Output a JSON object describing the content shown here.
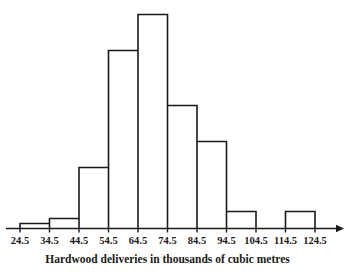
{
  "chart_data": {
    "type": "bar",
    "title": "",
    "subtitle": "",
    "xlabel": "Hardwood deliveries in thousands of cubic metres",
    "ylabel": "",
    "grid": false,
    "legend": null,
    "bin_edges": [
      24.5,
      34.5,
      44.5,
      54.5,
      64.5,
      74.5,
      84.5,
      94.5,
      104.5,
      114.5,
      124.5
    ],
    "tick_labels": [
      "24.5",
      "34.5",
      "44.5",
      "54.5",
      "64.5",
      "74.5",
      "84.5",
      "94.5",
      "104.5",
      "114.5",
      "124.5"
    ],
    "categories": [
      "24.5-34.5",
      "34.5-44.5",
      "44.5-54.5",
      "54.5-64.5",
      "64.5-74.5",
      "74.5-84.5",
      "84.5-94.5",
      "94.5-104.5",
      "104.5-114.5",
      "114.5-124.5"
    ],
    "values": [
      1,
      2,
      12,
      35,
      42,
      24,
      17,
      3,
      0,
      3
    ],
    "bar_pixel_heights": [
      5,
      10,
      61,
      178,
      214,
      123,
      87,
      17,
      0,
      17
    ],
    "xlim": [
      24.5,
      124.5
    ],
    "ylim": [
      0,
      42
    ],
    "axis_arrow": true,
    "bar_fill_color": "#ffffff",
    "bar_stroke_color": "#1a1a1a",
    "axis_color": "#1a1a1a",
    "background_color": "#ffffff"
  },
  "caption": {
    "text": "Hardwood deliveries in thousands of cubic metres"
  }
}
